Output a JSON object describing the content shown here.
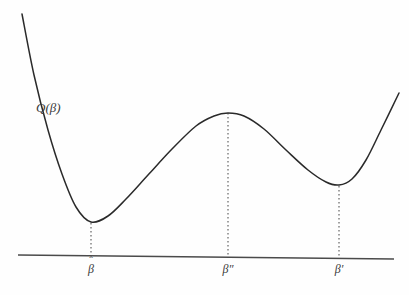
{
  "figure": {
    "title": "",
    "background_color": "#fefefe",
    "curve_color": "#2a2a2a",
    "axis_color": "#4a4a4a",
    "guide_color": "#555555",
    "text_color": "#3a3a3a",
    "curve_label": {
      "text": "Q(β)",
      "function_name": "Q",
      "open_paren": "(",
      "variable": "β",
      "close_paren": ")"
    },
    "axis": {
      "name": "horizontal-baseline",
      "x_start": 18,
      "x_end": 394,
      "y_start": 255,
      "y_end": 259
    },
    "tick_labels": [
      {
        "id": "beta-hat",
        "base": "β",
        "decoration": "ˆ",
        "text": "β̂",
        "x": 91
      },
      {
        "id": "beta-double-prime",
        "base": "β",
        "decoration": "″",
        "text": "β″",
        "x": 228
      },
      {
        "id": "beta-prime",
        "base": "β",
        "decoration": "′",
        "text": "β′",
        "x": 339
      }
    ],
    "guide_lines": [
      {
        "id": "guide-beta-hat",
        "x": 91,
        "y_top": 223,
        "y_bottom": 256
      },
      {
        "id": "guide-beta-double-prime",
        "x": 228,
        "y_top": 113,
        "y_bottom": 258
      },
      {
        "id": "guide-beta-prime",
        "x": 339,
        "y_top": 186,
        "y_bottom": 259
      }
    ]
  },
  "chart_data": {
    "type": "line",
    "title": "",
    "xlabel": "",
    "ylabel": "",
    "grid": false,
    "legend": false,
    "axis_style": "single horizontal baseline, no ticks, no numeric scale",
    "series": [
      {
        "name": "Q(β)",
        "description": "Smooth double-well objective function with a global minimum at beta-hat, a local maximum at beta-double-prime, and a local minimum at beta-prime",
        "points": [
          {
            "x": 22,
            "y": 14
          },
          {
            "x": 34,
            "y": 75
          },
          {
            "x": 48,
            "y": 130
          },
          {
            "x": 62,
            "y": 174
          },
          {
            "x": 76,
            "y": 207
          },
          {
            "x": 91,
            "y": 222
          },
          {
            "x": 108,
            "y": 216
          },
          {
            "x": 126,
            "y": 199
          },
          {
            "x": 148,
            "y": 175
          },
          {
            "x": 172,
            "y": 149
          },
          {
            "x": 196,
            "y": 126
          },
          {
            "x": 214,
            "y": 116
          },
          {
            "x": 228,
            "y": 113
          },
          {
            "x": 244,
            "y": 116
          },
          {
            "x": 264,
            "y": 129
          },
          {
            "x": 286,
            "y": 150
          },
          {
            "x": 308,
            "y": 170
          },
          {
            "x": 326,
            "y": 182
          },
          {
            "x": 339,
            "y": 185
          },
          {
            "x": 352,
            "y": 179
          },
          {
            "x": 366,
            "y": 160
          },
          {
            "x": 381,
            "y": 130
          },
          {
            "x": 399,
            "y": 93
          }
        ]
      }
    ],
    "critical_points": [
      {
        "label": "β̂",
        "role": "global minimum",
        "x": 91,
        "y": 222
      },
      {
        "label": "β″",
        "role": "local maximum",
        "x": 228,
        "y": 113
      },
      {
        "label": "β′",
        "role": "local minimum",
        "x": 339,
        "y": 185
      }
    ],
    "xlim": [
      0,
      409
    ],
    "ylim": [
      295,
      0
    ],
    "note": "y axis is inverted in pixel space; larger y value means lower on screen"
  }
}
